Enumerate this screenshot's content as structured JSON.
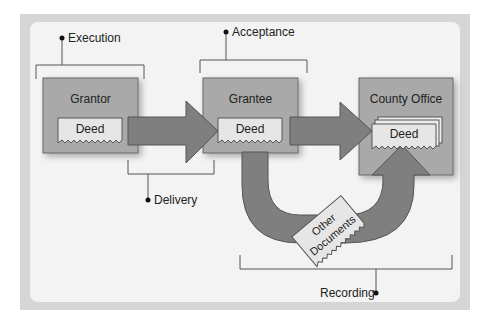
{
  "diagram": {
    "stages": {
      "execution": "Execution",
      "acceptance": "Acceptance",
      "delivery": "Delivery",
      "recording": "Recording"
    },
    "parties": {
      "grantor": "Grantor",
      "grantee": "Grantee",
      "county_office": "County Office"
    },
    "documents": {
      "deed": "Deed",
      "other_documents_line1": "Other",
      "other_documents_line2": "Documents"
    },
    "colors": {
      "box_fill": "#a9a9a9",
      "arrow_fill": "#7f7f7f",
      "deed_fill": "#e6e6e6",
      "panel": "#f3f3f3",
      "frame": "#d6d6d6"
    }
  }
}
